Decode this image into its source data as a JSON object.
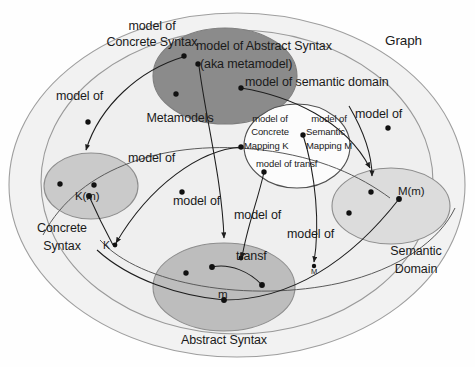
{
  "diagram": {
    "title": "Graph",
    "type": "set-theoretic model relationship diagram",
    "regions": [
      {
        "id": "graph",
        "label": "Graph",
        "fill": "#f2f2f2",
        "stroke": "#9a9a9a"
      },
      {
        "id": "metamodels",
        "label": "Metamodels",
        "fill": "#8b8b8b",
        "stroke": "#7a7a7a"
      },
      {
        "id": "concrete-syntax",
        "label": "Concrete Syntax",
        "fill": "#cacaca",
        "stroke": "#8a8a8a"
      },
      {
        "id": "abstract-syntax",
        "label": "Abstract Syntax",
        "fill": "#bcbcbc",
        "stroke": "#8a8a8a"
      },
      {
        "id": "semantic-domain",
        "label": "Semantic Domain",
        "fill": "#dedede",
        "stroke": "#8a8a8a"
      },
      {
        "id": "mappings",
        "label": "",
        "fill": "#ffffff",
        "stroke": "#555555"
      },
      {
        "id": "models",
        "label": "",
        "fill": "#ededed",
        "stroke": "#8a8a8a"
      }
    ],
    "labels": {
      "graph": "Graph",
      "metamodels": "Metamodels",
      "concrete_syntax_l1": "Concrete",
      "concrete_syntax_l2": "Syntax",
      "abstract_syntax": "Abstract Syntax",
      "semantic_domain_l1": "Semantic",
      "semantic_domain_l2": "Domain",
      "model_of_concrete_syntax_l1": "model of",
      "model_of_concrete_syntax_l2": "Concrete Syntax",
      "model_of_abstract_syntax_l1": "model of Abstract Syntax",
      "model_of_abstract_syntax_l2": "(aka metamodel)",
      "model_of_semantic_domain": "model of semantic domain",
      "model_of_concrete_mapping_l1": "model of",
      "model_of_concrete_mapping_l2": "Concrete",
      "model_of_concrete_mapping_l3": "Mapping K",
      "model_of_semantic_mapping_l1": "model of",
      "model_of_semantic_mapping_l2": "Semantic",
      "model_of_semantic_mapping_l3": "Mapping M",
      "model_of_transf": "model of transf",
      "model_of_left": "model of",
      "model_of_mid_upper": "model of",
      "model_of_mid_lower": "model of",
      "model_of_transf_arrow": "model of",
      "model_of_right_upper": "model of",
      "model_of_right_lower": "model of"
    },
    "elements": [
      {
        "id": "Km",
        "label": "K(m)",
        "region": "concrete-syntax"
      },
      {
        "id": "K",
        "label": "K",
        "region": "graph"
      },
      {
        "id": "m",
        "label": "m",
        "region": "abstract-syntax"
      },
      {
        "id": "transf",
        "label": "transf",
        "region": "abstract-syntax"
      },
      {
        "id": "M",
        "label": "M",
        "region": "graph"
      },
      {
        "id": "Mm",
        "label": "M(m)",
        "region": "semantic-domain"
      }
    ],
    "colors": {
      "background": "#fefefe",
      "outer_fill": "#f2f2f2",
      "dark_gray": "#8b8b8b",
      "mid_gray": "#cacaca",
      "light_gray": "#dedede",
      "text": "#1a1a1a",
      "line": "#222222"
    }
  }
}
